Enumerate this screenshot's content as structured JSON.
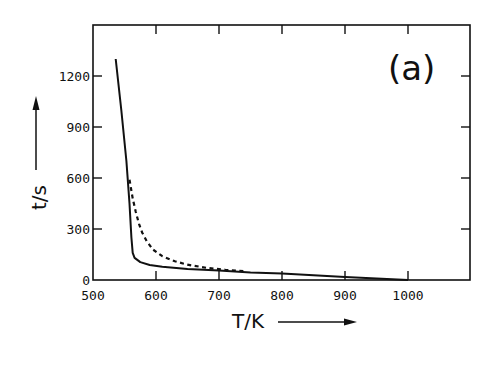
{
  "chart_data": {
    "type": "line",
    "title": "",
    "panel_label": "(a)",
    "xlabel": "T/K",
    "ylabel": "t/s",
    "xlim": [
      500,
      1100
    ],
    "ylim": [
      0,
      1450
    ],
    "x_ticks": [
      500,
      600,
      700,
      800,
      900,
      1000
    ],
    "x_tick_labels": [
      "500",
      "600",
      "700",
      "800",
      "900",
      "1000"
    ],
    "y_ticks": [
      0,
      300,
      600,
      900,
      1200
    ],
    "y_tick_labels": [
      "0",
      "300",
      "600",
      "900",
      "1200"
    ],
    "grid": false,
    "legend": null,
    "series": [
      {
        "name": "solid",
        "style": "solid",
        "x": [
          536,
          545,
          553,
          558,
          561,
          563,
          566,
          575,
          590,
          610,
          650,
          700,
          750,
          800,
          850,
          900,
          950,
          1000
        ],
        "y": [
          1300,
          1000,
          700,
          450,
          250,
          160,
          130,
          105,
          88,
          78,
          65,
          55,
          45,
          38,
          28,
          18,
          8,
          0
        ]
      },
      {
        "name": "dashed",
        "style": "dashed",
        "x": [
          558,
          563,
          568,
          573,
          578,
          585,
          595,
          610,
          630,
          650,
          680,
          710,
          740
        ],
        "y": [
          590,
          480,
          400,
          330,
          280,
          230,
          180,
          140,
          110,
          90,
          72,
          60,
          52
        ]
      }
    ]
  }
}
